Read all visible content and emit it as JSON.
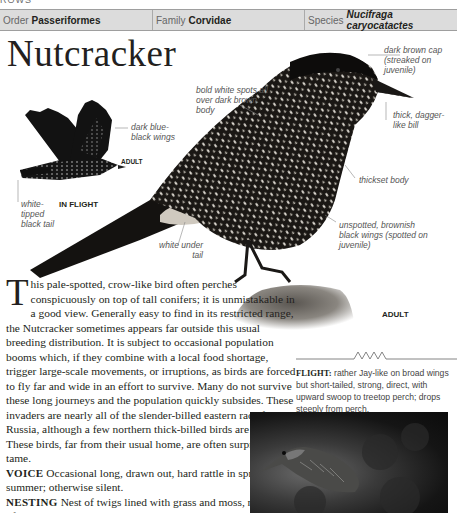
{
  "running_head": "ROWS",
  "taxonomy": {
    "order": {
      "label": "Order",
      "value": "Passeriformes"
    },
    "family": {
      "label": "Family",
      "value": "Corvidae"
    },
    "species": {
      "label": "Species",
      "value": "Nucifraga caryocatactes"
    }
  },
  "title": "Nutcracker",
  "figure": {
    "annotations": {
      "spots": "bold white spots all over dark brown body",
      "cap": "dark brown cap (streaked on juvenile)",
      "bill": "thick, dagger-like bill",
      "body": "thickset body",
      "wings_adult": "unspotted, brownish black wings (spotted on juvenile)",
      "under_tail": "white under tail",
      "wings_flight": "dark blue-black wings",
      "tail_flight": "white-tipped black tail"
    },
    "tags": {
      "flight_adult": "ADULT",
      "in_flight": "IN FLIGHT",
      "perched_adult": "ADULT"
    }
  },
  "body": {
    "dropcap": "T",
    "intro": "his pale-spotted, crow-like bird often perches conspicuously on top of tall conifers; it is unmistakable in a good view. Generally easy to find in its restricted range, the Nutcracker sometimes appears far outside this usual breeding distribution. It is subject to occasional population booms which, if they combine with a local food shortage, trigger large-scale movements, or irruptions, as birds are forced to fly far and wide in an effort to survive. Many do not survive these long journeys and the population quickly subsides. These invaders are nearly all of the slender-billed eastern race from Russia, although a few northern thick-billed birds are involved. These birds, far from their usual home, are often surprisingly tame.",
    "voice_label": "VOICE",
    "voice": "Occasional long, drawn out, hard rattle in spring and summer; otherwise silent.",
    "nesting_label": "NESTING",
    "nesting": "Nest of twigs lined with grass and moss, near trunk of tree, usually spruce; 3 or 4 eggs; 1 brood; May–July."
  },
  "flight": {
    "label": "FLIGHT:",
    "text": "rather Jay-like on broad wings but short-tailed, strong, direct, with upward swoop to treetop perch; drops steeply from perch."
  },
  "photo": {
    "alt": "nutcracker-photo"
  }
}
